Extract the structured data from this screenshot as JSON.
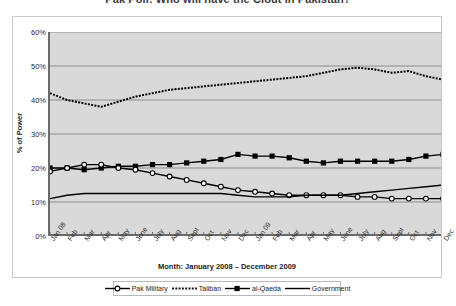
{
  "title": "Pak Poll: Who will have the Clout in Pakistan?",
  "axis": {
    "y_label": "% of Power",
    "x_title": "Month: January 2008 – December 2009",
    "y_ticks": [
      "0%",
      "10%",
      "20%",
      "30%",
      "40%",
      "50%",
      "60%"
    ]
  },
  "legend": {
    "items": [
      {
        "label": "Pak Military",
        "key": "line-open-diamond",
        "color": "#000000"
      },
      {
        "label": "Taliban",
        "key": "line-dotted",
        "color": "#1a1a1a"
      },
      {
        "label": "al-Qaeda",
        "key": "line-filled-square",
        "color": "#000000"
      },
      {
        "label": "Government",
        "key": "line-solid",
        "color": "#000000"
      }
    ]
  },
  "chart_data": {
    "type": "line",
    "title": "Pak Poll: Who will have the Clout in Pakistan?",
    "xlabel": "Month: January 2008 – December 2009",
    "ylabel": "% of Power",
    "ylim": [
      0,
      60
    ],
    "ytick_step": 10,
    "grid": true,
    "legend_position": "bottom",
    "categories": [
      "Jan 08",
      "Feb",
      "Mar",
      "Apr",
      "May",
      "June",
      "July",
      "Aug",
      "Sept",
      "Oct",
      "Nov",
      "Dec",
      "Jan 09",
      "Feb",
      "Mar",
      "Apr",
      "May",
      "June",
      "July",
      "Aug",
      "Sept",
      "Oct",
      "Nov",
      "Dec"
    ],
    "series": [
      {
        "name": "Taliban",
        "style": "dotted",
        "marker": "none",
        "values": [
          42,
          40,
          39,
          38,
          39.5,
          41,
          42,
          43,
          43.5,
          44,
          44.5,
          45,
          45.5,
          46,
          46.5,
          47,
          48,
          49,
          49.5,
          49,
          48,
          48.5,
          47,
          46
        ]
      },
      {
        "name": "al-Qaeda",
        "style": "solid",
        "marker": "filled-square",
        "values": [
          20,
          20,
          19.5,
          20,
          20.5,
          20.5,
          21,
          21,
          21.5,
          22,
          22.5,
          24,
          23.5,
          23.5,
          23,
          22,
          21.5,
          22,
          22,
          22,
          22,
          22.5,
          23.5,
          24
        ]
      },
      {
        "name": "Pak Military",
        "style": "solid",
        "marker": "open-diamond",
        "values": [
          19,
          20,
          21,
          21,
          20,
          19.5,
          18.5,
          17.5,
          16.5,
          15.5,
          14.5,
          13.5,
          13,
          12.5,
          12,
          12,
          12,
          12,
          11.5,
          11.5,
          11,
          11,
          11,
          11
        ]
      },
      {
        "name": "Government",
        "style": "solid",
        "marker": "none",
        "values": [
          11,
          12,
          12.5,
          12.5,
          12.5,
          12.5,
          12.5,
          12.5,
          12.5,
          12.5,
          12.5,
          12,
          11.5,
          11.5,
          11.5,
          12,
          12,
          12,
          12.5,
          13,
          13.5,
          14,
          14.5,
          15
        ]
      }
    ]
  }
}
